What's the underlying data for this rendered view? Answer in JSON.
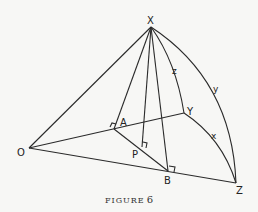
{
  "figure": {
    "caption_word": "FIGURE",
    "caption_number": "6",
    "points": {
      "X": "X",
      "Y": "Y",
      "Z": "Z",
      "O": "O",
      "A": "A",
      "B": "B",
      "P": "P"
    },
    "arcs": {
      "x": "x",
      "y": "y",
      "z": "z"
    }
  }
}
